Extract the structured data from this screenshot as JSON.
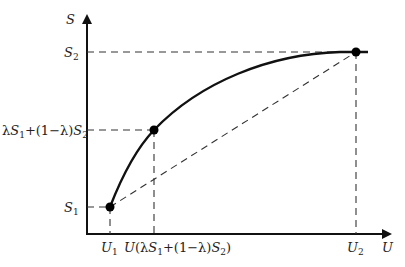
{
  "diagram": {
    "type": "concave-function-plot",
    "axes": {
      "x_label": "U",
      "y_label": "S"
    },
    "y_ticks": [
      {
        "id": "s2",
        "base": "S",
        "sub": "2"
      },
      {
        "id": "mix",
        "text": "λS₁+(1−λ)S₂"
      },
      {
        "id": "s1",
        "base": "S",
        "sub": "1"
      }
    ],
    "x_ticks": [
      {
        "id": "u1",
        "base": "U",
        "sub": "1"
      },
      {
        "id": "umix",
        "text": "U(λS₁+(1−λ)S₂)"
      },
      {
        "id": "u2",
        "base": "U",
        "sub": "2"
      }
    ],
    "points": [
      {
        "name": "P1",
        "U": "U₁",
        "S": "S₁"
      },
      {
        "name": "Pmix",
        "U": "U(λS₁+(1−λ)S₂)",
        "S": "λS₁+(1−λ)S₂"
      },
      {
        "name": "P2",
        "U": "U₂",
        "S": "S₂"
      }
    ],
    "curve": "solid concave curve from P1 through Pmix to P2",
    "chord": "dashed straight line from P1 to P2",
    "colors": {
      "line": "#111111",
      "dash": "#333333",
      "text": "#222222"
    }
  },
  "labels": {
    "S": "S",
    "U": "U",
    "S_base": "S",
    "U_base": "U",
    "sub1": "1",
    "sub2": "2",
    "lambda": "λ",
    "plus_open": "+(1−",
    "close_paren": ")",
    "U_open": "U(",
    "lambda_close": "λ)"
  }
}
